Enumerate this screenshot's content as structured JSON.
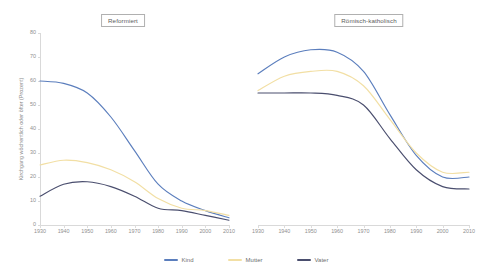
{
  "chart_data": {
    "type": "line",
    "title": "",
    "panels": [
      {
        "title": "Reformiert",
        "xlabel": "",
        "ylabel": "Kirchgang wöchentlich oder öfter (Prozent)",
        "x": [
          1930,
          1940,
          1950,
          1960,
          1970,
          1980,
          1990,
          2000,
          2010
        ],
        "xlim": [
          1930,
          2010
        ],
        "ylim": [
          0,
          80
        ],
        "yticks": [
          0,
          10,
          20,
          30,
          40,
          50,
          60,
          70,
          80
        ],
        "xticks": [
          1930,
          1940,
          1950,
          1960,
          1970,
          1980,
          1990,
          2000,
          2010
        ],
        "grid": false,
        "series": [
          {
            "name": "Kind",
            "color": "#5b7ebd",
            "values": [
              60,
              59,
              55,
              45,
              31,
              17,
              10,
              6,
              3
            ]
          },
          {
            "name": "Mutter",
            "color": "#f2dfa4",
            "values": [
              25,
              27,
              26,
              23,
              18,
              11,
              7,
              6,
              4
            ]
          },
          {
            "name": "Vater",
            "color": "#4a4e6e",
            "values": [
              12,
              17,
              18,
              16,
              12,
              7,
              6,
              4,
              2
            ]
          }
        ]
      },
      {
        "title": "Römisch-katholisch",
        "xlabel": "",
        "ylabel": "",
        "x": [
          1930,
          1940,
          1950,
          1960,
          1970,
          1980,
          1990,
          2000,
          2010
        ],
        "xlim": [
          1930,
          2010
        ],
        "ylim": [
          0,
          80
        ],
        "yticks": [
          0,
          10,
          20,
          30,
          40,
          50,
          60,
          70,
          80
        ],
        "xticks": [
          1930,
          1940,
          1950,
          1960,
          1970,
          1980,
          1990,
          2000,
          2010
        ],
        "grid": false,
        "series": [
          {
            "name": "Kind",
            "color": "#5b7ebd",
            "values": [
              63,
              70,
              73,
              72,
              64,
              46,
              29,
              20,
              20
            ]
          },
          {
            "name": "Mutter",
            "color": "#f2dfa4",
            "values": [
              56,
              62,
              64,
              64,
              58,
              44,
              30,
              22,
              22
            ]
          },
          {
            "name": "Vater",
            "color": "#4a4e6e",
            "values": [
              55,
              55,
              55,
              54,
              50,
              36,
              23,
              16,
              15
            ]
          }
        ]
      }
    ],
    "legend": {
      "position": "bottom",
      "entries": [
        {
          "label": "Kind",
          "color": "#5b7ebd"
        },
        {
          "label": "Mutter",
          "color": "#f2dfa4"
        },
        {
          "label": "Vater",
          "color": "#4a4e6e"
        }
      ]
    }
  },
  "colors": {
    "kind": "#5b7ebd",
    "mutter": "#f2dfa4",
    "vater": "#4a4e6e",
    "axis": "#d9d9d9",
    "tick_text": "#8f8f8f",
    "title_text": "#5b5b5b",
    "background": "#ffffff"
  }
}
